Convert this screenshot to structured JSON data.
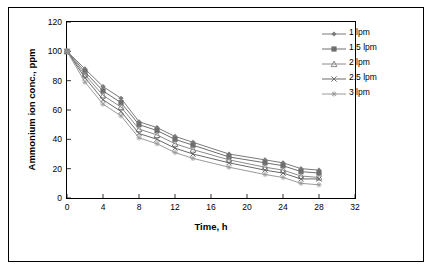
{
  "chart_data": {
    "type": "line",
    "title": "",
    "xlabel": "Time, h",
    "ylabel": "Ammonium ion conc., ppm",
    "xlim": [
      0,
      32
    ],
    "ylim": [
      0,
      120
    ],
    "xticks": [
      0,
      4,
      8,
      12,
      16,
      20,
      24,
      28,
      32
    ],
    "yticks": [
      0,
      20,
      40,
      60,
      80,
      100,
      120
    ],
    "grid": false,
    "legend_position": "top-right",
    "x": [
      0,
      2,
      4,
      6,
      8,
      10,
      12,
      14,
      18,
      22,
      24,
      26,
      28
    ],
    "series": [
      {
        "name": "1 lpm",
        "marker": "diamond",
        "color": "#7b7b7b",
        "values": [
          100,
          88,
          76,
          68,
          52,
          48,
          42,
          38,
          30,
          26,
          24,
          20,
          19
        ]
      },
      {
        "name": "1.5 lpm",
        "marker": "square",
        "color": "#6e6e6e",
        "values": [
          100,
          86,
          73,
          65,
          50,
          46,
          40,
          36,
          28,
          24,
          22,
          18,
          17
        ]
      },
      {
        "name": "2 lpm",
        "marker": "triangle",
        "color": "#8a8a8a",
        "values": [
          100,
          84,
          70,
          62,
          47,
          43,
          37,
          33,
          26,
          21,
          19,
          15,
          14
        ]
      },
      {
        "name": "2.5 lpm",
        "marker": "cross",
        "color": "#6a6a6a",
        "values": [
          100,
          82,
          67,
          59,
          44,
          40,
          34,
          30,
          24,
          19,
          17,
          13,
          13
        ]
      },
      {
        "name": "3 lpm",
        "marker": "asterisk",
        "color": "#9a9a9a",
        "values": [
          100,
          79,
          64,
          56,
          41,
          37,
          31,
          27,
          21,
          16,
          14,
          10,
          9
        ]
      }
    ]
  }
}
